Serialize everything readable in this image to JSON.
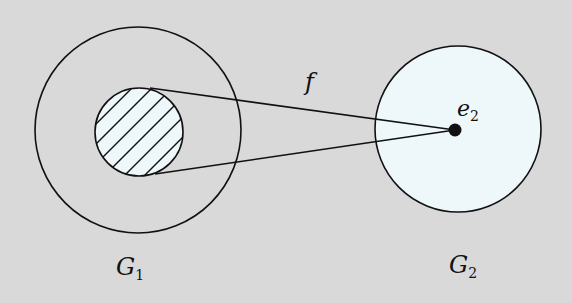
{
  "diagram": {
    "background": "#d9d9d9",
    "fill_light": "#eef8fb",
    "stroke": "#111111",
    "groups": [
      {
        "name": "G",
        "subscript": "1",
        "outer_circle": {
          "cx": 138,
          "cy": 130,
          "r": 103
        },
        "hatched_subset": {
          "cx": 139,
          "cy": 132,
          "r": 44
        }
      },
      {
        "name": "G",
        "subscript": "2",
        "circle": {
          "cx": 458,
          "cy": 129,
          "r": 83
        }
      }
    ],
    "map_label": "f",
    "point": {
      "name": "e",
      "subscript": "2",
      "cx": 455,
      "cy": 130,
      "r": 6
    }
  },
  "labels": {
    "g1_main": "G",
    "g1_sub": "1",
    "g2_main": "G",
    "g2_sub": "2",
    "f": "f",
    "e2_main": "e",
    "e2_sub": "2"
  }
}
